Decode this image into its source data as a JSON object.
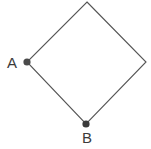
{
  "figure": {
    "type": "geometry-diagram",
    "background_color": "#ffffff",
    "shape": {
      "name": "square-rotated-45",
      "description": "square drawn as a diamond",
      "stroke_color": "#555555",
      "stroke_width": 1.1,
      "fill": "none",
      "vertices": [
        {
          "id": "top",
          "x": 87,
          "y": 2
        },
        {
          "id": "right",
          "x": 146,
          "y": 62
        },
        {
          "id": "bottom",
          "x": 86,
          "y": 124
        },
        {
          "id": "left",
          "x": 27,
          "y": 62
        }
      ],
      "path": "M 87 2 L 146 62 L 86 124 L 27 62 Z"
    },
    "points": [
      {
        "id": "point-a",
        "label": "A",
        "x": 27,
        "y": 62,
        "radius": 3.6,
        "color": "#4a4a4a",
        "label_position": "left"
      },
      {
        "id": "point-b",
        "label": "B",
        "x": 86,
        "y": 124,
        "radius": 3.6,
        "color": "#3a3a3a",
        "label_position": "below"
      }
    ],
    "labels": {
      "a": "A",
      "b": "B"
    }
  }
}
